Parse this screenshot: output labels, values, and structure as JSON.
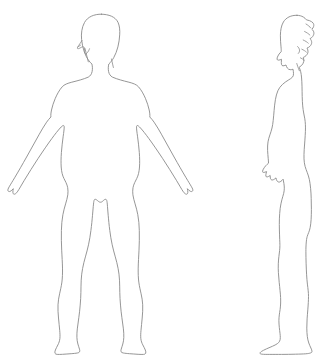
{
  "page": {
    "background_color": "#ffffff",
    "width": 333,
    "height": 359
  },
  "drawing": {
    "style": "line-art outline illustration",
    "stroke_color": "#8a8a8a",
    "fill_color": "#ffffff",
    "stroke_width": 0.9,
    "subject": "adult female figure",
    "description": "Two unshaded contour drawings of a standing human body: an anterior (front) view with arms abducted away from the torso, and a lateral (side) right-facing-left profile view with arms at the sides."
  },
  "figures": [
    {
      "id": "front-figure",
      "name": "front-view-body",
      "view": "front",
      "pose": "standing, arms abducted roughly 45 degrees, legs slightly apart",
      "bounds": {
        "x": 8,
        "y": 14,
        "width": 198,
        "height": 341
      },
      "parts": [
        {
          "name": "head",
          "label": "Head"
        },
        {
          "name": "hair",
          "label": "Hair"
        },
        {
          "name": "neck",
          "label": "Neck"
        },
        {
          "name": "left-shoulder",
          "label": "Left shoulder"
        },
        {
          "name": "right-shoulder",
          "label": "Right shoulder"
        },
        {
          "name": "torso",
          "label": "Torso"
        },
        {
          "name": "left-arm",
          "label": "Left arm"
        },
        {
          "name": "right-arm",
          "label": "Right arm"
        },
        {
          "name": "left-hand",
          "label": "Left hand"
        },
        {
          "name": "right-hand",
          "label": "Right hand"
        },
        {
          "name": "hips",
          "label": "Hips"
        },
        {
          "name": "left-leg",
          "label": "Left leg"
        },
        {
          "name": "right-leg",
          "label": "Right leg"
        },
        {
          "name": "left-foot",
          "label": "Left foot"
        },
        {
          "name": "right-foot",
          "label": "Right foot"
        }
      ]
    },
    {
      "id": "side-figure",
      "name": "side-view-body",
      "view": "side",
      "facing": "left",
      "pose": "standing upright, arm hanging at side, hair tied in a bun at the back of the head",
      "bounds": {
        "x": 258,
        "y": 15,
        "width": 75,
        "height": 340
      },
      "parts": [
        {
          "name": "head-profile",
          "label": "Head profile"
        },
        {
          "name": "hair-bun",
          "label": "Hair bun"
        },
        {
          "name": "neck",
          "label": "Neck"
        },
        {
          "name": "chest",
          "label": "Chest"
        },
        {
          "name": "back",
          "label": "Back"
        },
        {
          "name": "arm",
          "label": "Arm"
        },
        {
          "name": "hand",
          "label": "Hand"
        },
        {
          "name": "buttock",
          "label": "Buttock"
        },
        {
          "name": "leg",
          "label": "Leg"
        },
        {
          "name": "foot",
          "label": "Foot"
        }
      ]
    }
  ]
}
